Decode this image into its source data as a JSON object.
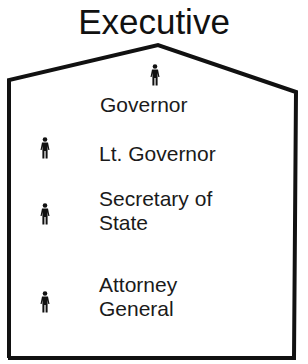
{
  "title": "Executive",
  "colors": {
    "line": "#111111",
    "text": "#1a1a1a",
    "background": "#ffffff"
  },
  "officials": [
    {
      "label": "Governor",
      "icon": "person-icon"
    },
    {
      "label": "Lt. Governor",
      "icon": "person-icon"
    },
    {
      "label_line1": "Secretary of",
      "label_line2": "State",
      "icon": "person-icon"
    },
    {
      "label_line1": "Attorney",
      "label_line2": "General",
      "icon": "person-icon"
    }
  ]
}
